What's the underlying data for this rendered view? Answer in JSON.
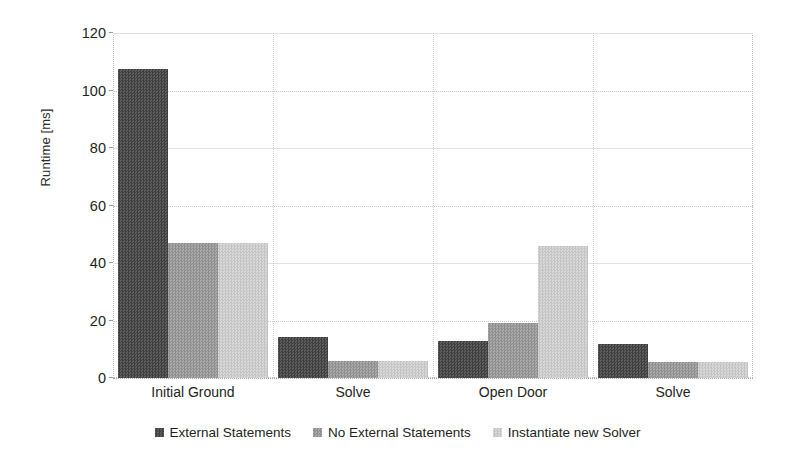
{
  "chart_data": {
    "type": "bar",
    "title": "",
    "subtitle": "",
    "xlabel": "",
    "ylabel": "Runtime [ms]",
    "ylim": [
      0,
      120
    ],
    "yticks": [
      0,
      20,
      40,
      60,
      80,
      100,
      120
    ],
    "ytick_labels": [
      "0",
      "20",
      "40",
      "60",
      "80",
      "100",
      "120"
    ],
    "grid": true,
    "grid_axis": "both",
    "legend_position": "bottom-center",
    "categories": [
      "Initial Ground",
      "Solve",
      "Open Door",
      "Solve"
    ],
    "series": [
      {
        "name": "External Statements",
        "color": "#4f4f4f",
        "values": [
          107.5,
          14.2,
          13.0,
          12.0
        ]
      },
      {
        "name": "No External Statements",
        "color": "#9e9e9e",
        "values": [
          47.0,
          6.0,
          19.0,
          5.5
        ]
      },
      {
        "name": "Instantiate new Solver",
        "color": "#cfcfcf",
        "values": [
          47.0,
          6.0,
          46.0,
          5.5
        ]
      }
    ]
  },
  "axes": {
    "y_axis_title": "Runtime [ms]"
  },
  "legend": {
    "entries": [
      "External Statements",
      "No External Statements",
      "Instantiate new Solver"
    ]
  }
}
